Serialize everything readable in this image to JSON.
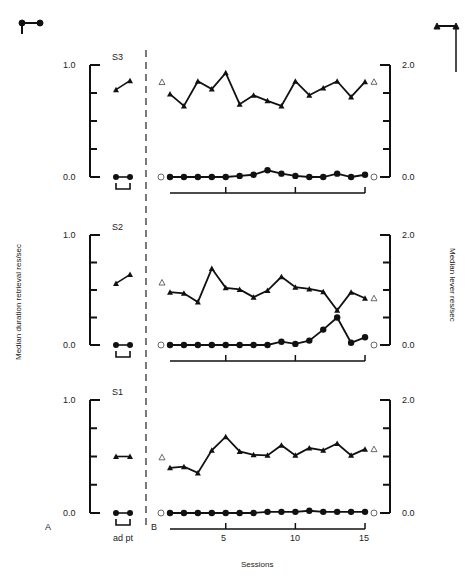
{
  "legend": {
    "top_left_icon": "filled-circle-line-legend",
    "top_right_icon": "filled-triangle-line-legend"
  },
  "labels": {
    "left_axis": "Median duration retrieval res/sec",
    "right_axis": "Median lever res/sec",
    "x_axis": "Sessions",
    "panel_a": "A",
    "panel_b": "B",
    "adpt": "ad pt",
    "left_ticks": [
      "1.0",
      "0.0"
    ],
    "right_ticks": [
      "2.0",
      "0.0"
    ],
    "x_ticks": [
      "5",
      "10",
      "15"
    ]
  },
  "panels": [
    {
      "subject": "S3"
    },
    {
      "subject": "S2"
    },
    {
      "subject": "S1"
    }
  ],
  "chart_data": [
    {
      "type": "line",
      "title": "S3",
      "xlabel": "Sessions",
      "ylabel_left": "Median duration retrieval res/sec",
      "ylabel_right": "Median lever res/sec",
      "ylim_left": [
        0,
        1.0
      ],
      "ylim_right": [
        0,
        2.0
      ],
      "adaptation": {
        "categories": [
          "ad",
          "pt"
        ],
        "retrieval": [
          0.0,
          0.0
        ],
        "lever_left_scale": [
          0.78,
          0.86
        ]
      },
      "baseline_open_markers": {
        "lever_triangle_right": 1.66,
        "retrieval_circle_right": 0.0
      },
      "x": [
        1,
        2,
        3,
        4,
        5,
        6,
        7,
        8,
        9,
        10,
        11,
        12,
        13,
        14,
        15
      ],
      "series": [
        {
          "name": "Lever (triangles, right axis)",
          "values": [
            1.48,
            1.27,
            1.71,
            1.57,
            1.86,
            1.3,
            1.46,
            1.36,
            1.27,
            1.71,
            1.46,
            1.59,
            1.71,
            1.43,
            1.7
          ]
        },
        {
          "name": "Retrieval (circles, left axis)",
          "values": [
            0.0,
            0.0,
            0.0,
            0.0,
            0.0,
            0.01,
            0.02,
            0.06,
            0.03,
            0.01,
            0.0,
            0.0,
            0.03,
            0.0,
            0.02
          ]
        }
      ]
    },
    {
      "type": "line",
      "title": "S2",
      "xlabel": "Sessions",
      "ylim_left": [
        0,
        1.0
      ],
      "ylim_right": [
        0,
        2.0
      ],
      "adaptation": {
        "categories": [
          "ad",
          "pt"
        ],
        "retrieval": [
          0.0,
          0.0
        ],
        "lever_left_scale": [
          0.56,
          0.64
        ]
      },
      "baseline_open_markers": {
        "lever_triangle_right": 1.1,
        "retrieval_circle_right": 0.0
      },
      "x": [
        1,
        2,
        3,
        4,
        5,
        6,
        7,
        8,
        9,
        10,
        11,
        12,
        13,
        14,
        15
      ],
      "series": [
        {
          "name": "Lever (triangles, right axis)",
          "values": [
            0.96,
            0.94,
            0.78,
            1.39,
            1.04,
            1.01,
            0.87,
            0.99,
            1.24,
            1.05,
            1.02,
            0.97,
            0.63,
            0.96,
            0.85
          ]
        },
        {
          "name": "Retrieval (circles, left axis)",
          "values": [
            0.0,
            0.0,
            0.0,
            0.0,
            0.0,
            0.0,
            0.0,
            0.0,
            0.03,
            0.01,
            0.04,
            0.14,
            0.25,
            0.02,
            0.07
          ]
        }
      ]
    },
    {
      "type": "line",
      "title": "S1",
      "xlabel": "Sessions",
      "ylim_left": [
        0,
        1.0
      ],
      "ylim_right": [
        0,
        2.0
      ],
      "adaptation": {
        "categories": [
          "ad",
          "pt"
        ],
        "retrieval": [
          0.0,
          0.0
        ],
        "lever_left_scale": [
          0.5,
          0.5
        ]
      },
      "baseline_open_markers": {
        "lever_triangle_right": 0.95,
        "retrieval_circle_right": 0.0
      },
      "x": [
        1,
        2,
        3,
        4,
        5,
        6,
        7,
        8,
        9,
        10,
        11,
        12,
        13,
        14,
        15
      ],
      "series": [
        {
          "name": "Lever (triangles, right axis)",
          "values": [
            0.8,
            0.82,
            0.71,
            1.11,
            1.35,
            1.09,
            1.03,
            1.02,
            1.2,
            1.02,
            1.15,
            1.11,
            1.23,
            1.02,
            1.13
          ]
        },
        {
          "name": "Retrieval (circles, left axis)",
          "values": [
            0.0,
            0.0,
            0.0,
            0.0,
            0.0,
            0.0,
            0.0,
            0.01,
            0.01,
            0.01,
            0.02,
            0.01,
            0.01,
            0.01,
            0.01
          ]
        }
      ]
    }
  ]
}
